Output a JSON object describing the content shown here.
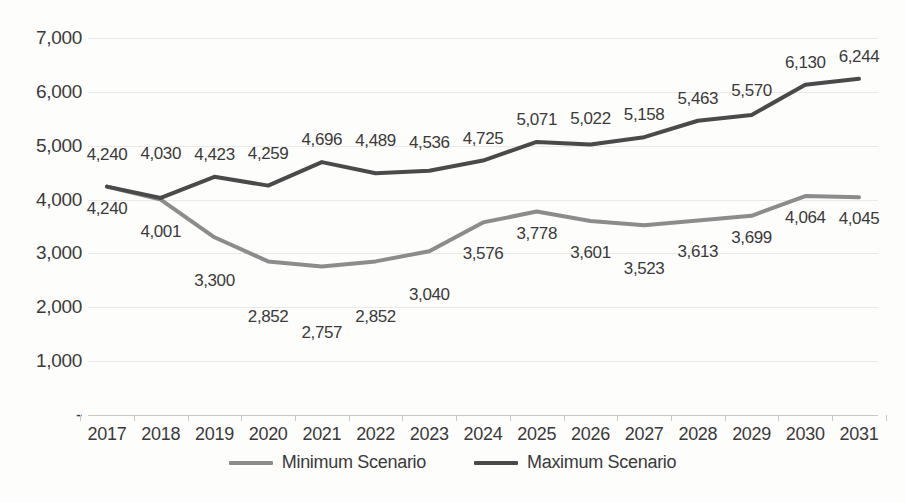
{
  "chart_data": {
    "type": "line",
    "title": "",
    "subtitle": "",
    "xlabel": "",
    "ylabel": "",
    "categories": [
      "2017",
      "2018",
      "2019",
      "2020",
      "2021",
      "2022",
      "2023",
      "2024",
      "2025",
      "2026",
      "2027",
      "2028",
      "2029",
      "2030",
      "2031"
    ],
    "series": [
      {
        "name": "Minimum Scenario",
        "color": "#8c8c8c",
        "values": [
          4240,
          4001,
          3300,
          2852,
          2757,
          2852,
          3040,
          3576,
          3778,
          3601,
          3523,
          3613,
          3699,
          4064,
          4045
        ],
        "labels": [
          "4,240",
          "4,001",
          "3,300",
          "2,852",
          "2,757",
          "2,852",
          "3,040",
          "3,576",
          "3,778",
          "3,601",
          "3,523",
          "3,613",
          "3,699",
          "4,064",
          "4,045"
        ]
      },
      {
        "name": "Maximum Scenario",
        "color": "#4a4a4a",
        "values": [
          4240,
          4030,
          4423,
          4259,
          4696,
          4489,
          4536,
          4725,
          5071,
          5022,
          5158,
          5463,
          5570,
          6130,
          6244
        ],
        "labels": [
          "4,240",
          "4,030",
          "4,423",
          "4,259",
          "4,696",
          "4,489",
          "4,536",
          "4,725",
          "5,071",
          "5,022",
          "5,158",
          "5,463",
          "5,570",
          "6,130",
          "6,244"
        ]
      }
    ],
    "ylim": [
      0,
      7000
    ],
    "yticks": [
      7000,
      6000,
      5000,
      4000,
      3000,
      2000,
      1000,
      0
    ],
    "ytick_labels": [
      "7,000",
      "6,000",
      "5,000",
      "4,000",
      "3,000",
      "2,000",
      "1,000",
      "-"
    ],
    "grid": true,
    "legend_position": "bottom",
    "background_color": "#fdfdfc",
    "gridline_color": "#e9e9e6",
    "text_color": "#3a3a3a"
  },
  "legend": {
    "entries": [
      {
        "label": "Minimum Scenario",
        "color": "#8c8c8c"
      },
      {
        "label": "Maximum Scenario",
        "color": "#4a4a4a"
      }
    ]
  }
}
